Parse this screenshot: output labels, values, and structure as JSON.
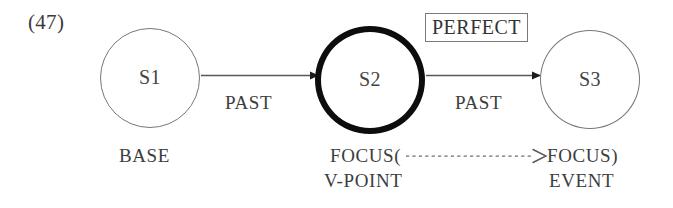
{
  "figure": {
    "example_number": "(47)",
    "background_color": "#ffffff",
    "ink_color": "#3d3d3d",
    "emphasis_color": "#0d0d0d"
  },
  "nodes": [
    {
      "id": "s1",
      "label": "S1",
      "emphasis": "normal"
    },
    {
      "id": "s2",
      "label": "S2",
      "emphasis": "bold"
    },
    {
      "id": "s3",
      "label": "S3",
      "emphasis": "normal"
    }
  ],
  "edges": [
    {
      "id": "e1",
      "from": "s1",
      "to": "s2",
      "label": "PAST",
      "style": "solid-arrow"
    },
    {
      "id": "e2",
      "from": "s2",
      "to": "s3",
      "label": "PAST",
      "style": "solid-arrow"
    }
  ],
  "aspect_box": {
    "label": "PERFECT",
    "border_color": "#7a7a7a"
  },
  "annotations": {
    "base": "BASE",
    "focus_open": "FOCUS(",
    "focus_close": "FOCUS)",
    "v_point": "V-POINT",
    "event": "EVENT"
  },
  "coreference_link": {
    "style": "dotted-arrow",
    "from": "focus_open",
    "to": "focus_close"
  }
}
